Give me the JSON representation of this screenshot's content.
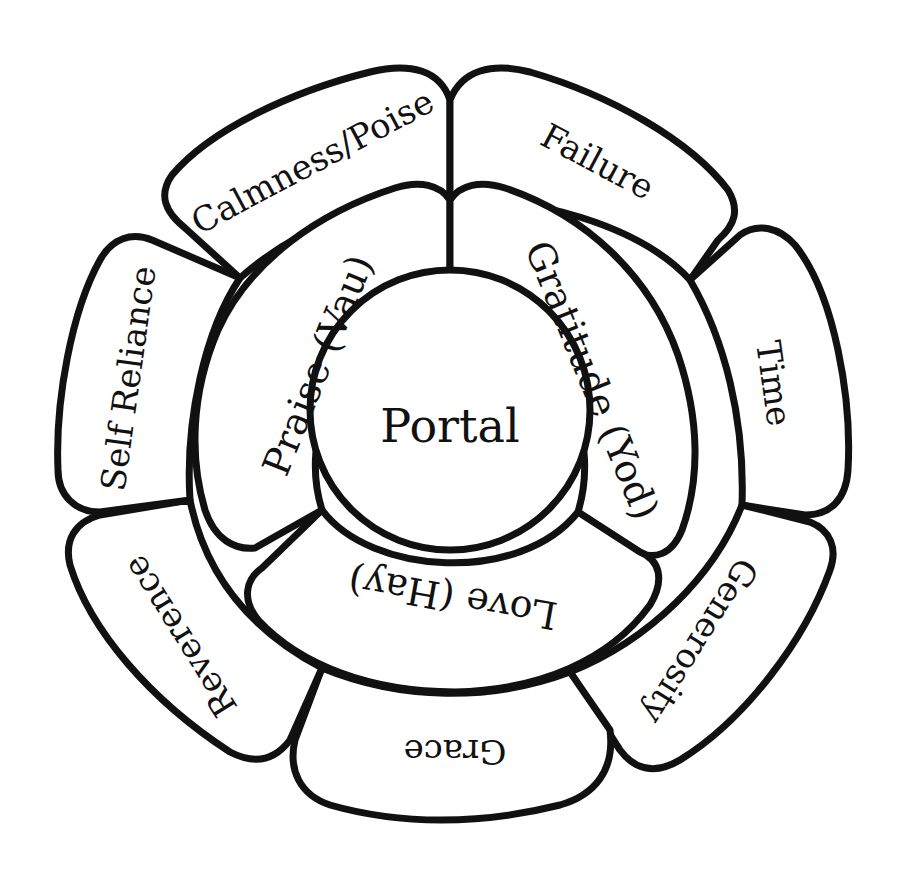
{
  "diagram": {
    "center": {
      "label": "Portal"
    },
    "inner_ring": [
      {
        "label": "Praise (Vau)"
      },
      {
        "label": "Gratitude (Yod)"
      },
      {
        "label": "Love (Hay)"
      }
    ],
    "outer_ring": [
      {
        "label": "Calmness/Poise"
      },
      {
        "label": "Failure"
      },
      {
        "label": "Time"
      },
      {
        "label": "Generosity"
      },
      {
        "label": "Grace"
      },
      {
        "label": "Reverence"
      },
      {
        "label": "Self Reliance"
      }
    ],
    "colors": {
      "stroke": "#111111",
      "fill": "#ffffff",
      "text": "#111111"
    }
  }
}
